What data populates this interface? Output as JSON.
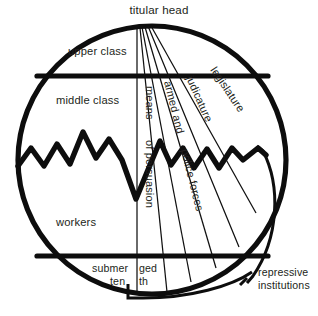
{
  "figure": {
    "title": "titular head",
    "colors": {
      "ink": "#0d0d0d",
      "text": "#231f20",
      "background": "#ffffff"
    }
  },
  "labels": {
    "titular_head": "titular head",
    "upper_class": "upper  class",
    "middle_class": "middle class",
    "workers": "workers",
    "submerged_line1": "submer",
    "submerged_line2": "ged",
    "submerged_line3": "ten",
    "submerged_line4": "th",
    "repressive_line1": "repressive",
    "repressive_line2": "institutions"
  },
  "wedges": [
    {
      "id": "means-of-persuasion",
      "line1": "means",
      "line2": "of persuasion"
    },
    {
      "id": "armed-and-police-forces",
      "line1": "armed and",
      "line2": "police forces"
    },
    {
      "id": "judicature",
      "line1": "judicature"
    },
    {
      "id": "legislature",
      "line1": "legislature"
    }
  ],
  "strata": [
    {
      "id": "upper-class",
      "label": "upper  class"
    },
    {
      "id": "middle-class",
      "label": "middle class"
    },
    {
      "id": "workers",
      "label": "workers"
    },
    {
      "id": "submerged-tenth",
      "label": "submerged tenth"
    }
  ],
  "annotations": {
    "repressive_institutions": "repressive institutions"
  }
}
